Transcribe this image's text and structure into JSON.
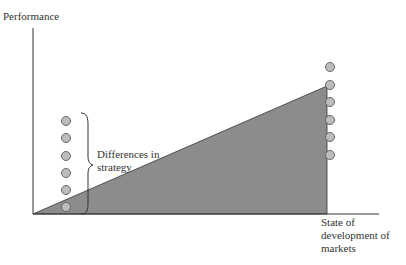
{
  "diagram": {
    "y_axis_label": "Performance",
    "x_axis_label_line1": "State of",
    "x_axis_label_line2": "development of",
    "x_axis_label_line3": "markets",
    "brace_label_line1": "Differences in",
    "brace_label_line2": "strategy",
    "colors": {
      "axis": "#333333",
      "triangle_fill": "#8c8c8c",
      "circle_fill": "#bdbdbd",
      "circle_stroke": "#666666"
    },
    "left_circles_count": 6,
    "right_circles_count": 6
  }
}
